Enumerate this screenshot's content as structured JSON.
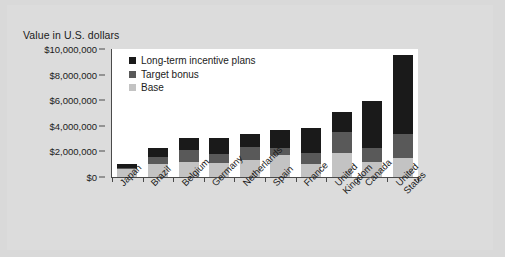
{
  "chart_data": {
    "type": "bar",
    "title": "",
    "subtitle": "",
    "ylabel": "Value in U.S. dollars",
    "xlabel": "",
    "stacked": true,
    "grid": false,
    "legend_position": "inside-top-left",
    "ylim": [
      0,
      10000000
    ],
    "ytick_values": [
      0,
      2000000,
      4000000,
      6000000,
      8000000,
      10000000
    ],
    "ytick_labels": [
      "$0",
      "$2,000,000",
      "$4,000,000",
      "$6,000,000",
      "$8,000,000",
      "$10,000,000"
    ],
    "categories": [
      "Japan",
      "Brazil",
      "Belgium",
      "Germany",
      "Netherlands",
      "Spain",
      "France",
      "United Kingdom",
      "Canada",
      "United States"
    ],
    "series": [
      {
        "name": "Base",
        "color": "#c3c3c3",
        "values": [
          600000,
          1000000,
          1200000,
          1100000,
          1300000,
          1700000,
          1050000,
          1850000,
          1200000,
          1450000
        ]
      },
      {
        "name": "Target bonus",
        "color": "#595959",
        "values": [
          100000,
          550000,
          900000,
          700000,
          1050000,
          600000,
          800000,
          1650000,
          1050000,
          1900000
        ]
      },
      {
        "name": "Long-term incentive plans",
        "color": "#1a1a1a",
        "values": [
          300000,
          700000,
          950000,
          1250000,
          1000000,
          1400000,
          1950000,
          1600000,
          3650000,
          6200000
        ]
      }
    ],
    "totals": [
      1000000,
      2250000,
      3050000,
      3050000,
      3350000,
      3700000,
      3800000,
      5100000,
      5900000,
      9550000
    ]
  },
  "legend": {
    "items": [
      {
        "label": "Long-term incentive plans",
        "color": "#1a1a1a",
        "swatch_name": "swatch-long-term-incentive-plans"
      },
      {
        "label": "Target bonus",
        "color": "#595959",
        "swatch_name": "swatch-target-bonus"
      },
      {
        "label": "Base",
        "color": "#c3c3c3",
        "swatch_name": "swatch-base"
      }
    ]
  },
  "colors": {
    "page_background": "#d9d9d9",
    "frame_background": "#dcdcdc",
    "plot_background": "#ffffff",
    "axis": "#4a4a4a",
    "text": "#1b1b1b"
  }
}
